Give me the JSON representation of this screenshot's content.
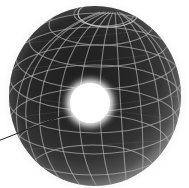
{
  "scene": {
    "title": "Wireframe globe with bright polar-view hotspot",
    "background_color": "#ffffff",
    "width": 189,
    "height": 188
  },
  "globe": {
    "name": "wireframe-globe",
    "center_x": 95,
    "center_y": 96,
    "radius_x": 86,
    "radius_y": 90,
    "surface_color_dark": "#242424",
    "surface_color_mid": "#3a3a3a",
    "limb_color": "#8d8d8d",
    "halo_color": "#d8d8d8",
    "grid_color": "#bfbfbf",
    "grid_line_width": 1.1,
    "grid_opacity": 0.78,
    "meridian_count": 12,
    "parallel_count": 9,
    "tilt_degrees": -8,
    "pole_visible": "north",
    "pole_cap": {
      "name": "north-pole-cap",
      "center_x": 108,
      "center_y": 14,
      "radius_x": 30,
      "radius_y": 13
    }
  },
  "hotspot": {
    "name": "bright-hotspot",
    "center_x": 90,
    "center_y": 103,
    "core_radius": 20,
    "glow_radius": 27,
    "core_color": "#ffffff",
    "glow_color": "#ffffff",
    "label": ""
  },
  "pointer": {
    "name": "pointer-leader-line",
    "color": "#1a1a1a",
    "width": 1.0,
    "x1": -2,
    "y1": 141,
    "x2": 72,
    "y2": 112
  },
  "parallels": {
    "y_positions": [
      14,
      33,
      53,
      72,
      92,
      112,
      131,
      151,
      170
    ]
  },
  "meridians": {
    "phase_offsets": [
      0,
      15,
      30,
      45,
      60,
      75,
      90,
      105,
      120,
      135,
      150,
      165
    ]
  }
}
